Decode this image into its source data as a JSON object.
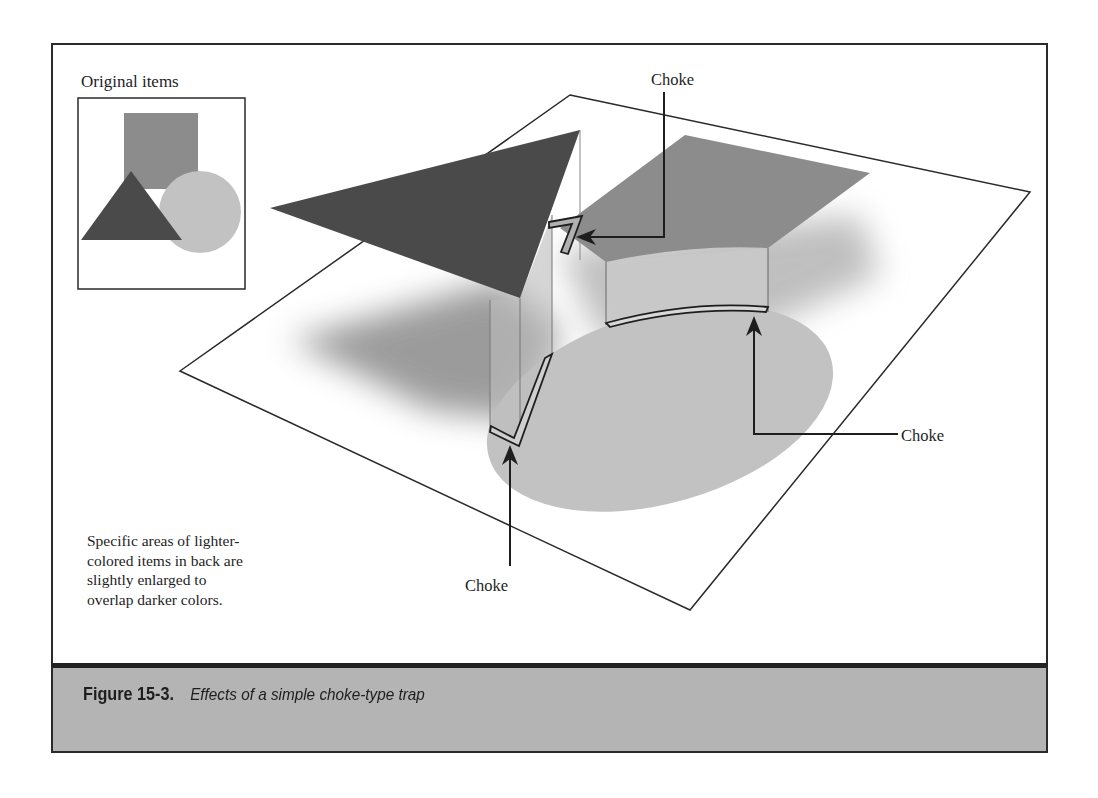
{
  "figure": {
    "inset_title": "Original items",
    "labels": {
      "choke_top": "Choke",
      "choke_right": "Choke",
      "choke_bottom": "Choke"
    },
    "note": "Specific areas of lighter-colored items in back are slightly enlarged to overlap darker colors.",
    "note_lines": [
      "Specific areas of lighter-",
      "colored items in back are",
      "slightly enlarged to",
      "overlap darker colors."
    ],
    "shapes": [
      {
        "name": "square",
        "fill": "#8c8c8c",
        "layer": "middle"
      },
      {
        "name": "triangle",
        "fill": "#4a4a4a",
        "layer": "top"
      },
      {
        "name": "circle",
        "fill": "#c2c2c2",
        "layer": "back"
      }
    ]
  },
  "caption": {
    "label": "Figure 15-3.",
    "description": "Effects of a simple choke-type trap"
  },
  "colors": {
    "caption_band": "#b4b4b4",
    "triangle": "#4a4a4a",
    "square": "#8c8c8c",
    "circle": "#c2c2c2",
    "line": "#222222"
  }
}
